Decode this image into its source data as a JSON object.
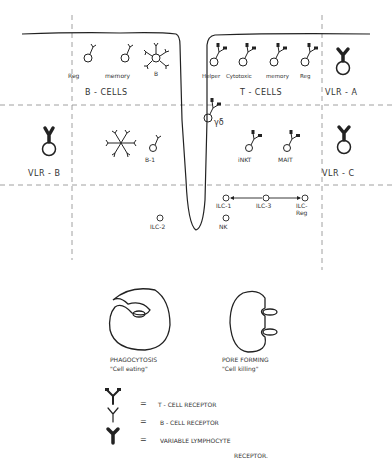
{
  "diagram": {
    "groups": {
      "b_cells": "B - CELLS",
      "t_cells": "T - CELLS",
      "vlr_a": "VLR - A",
      "vlr_b": "VLR - B",
      "vlr_c": "VLR - C"
    },
    "b_cell_types": [
      "Reg",
      "memory",
      "B",
      "B-1"
    ],
    "t_cell_types": [
      "Helper",
      "Cytotoxic",
      "memory",
      "Reg",
      "γδ",
      "iNKT",
      "MAIT"
    ],
    "innate_cells": [
      "ILC-2",
      "NK",
      "ILC-1",
      "ILC-3",
      "ILC-Reg"
    ],
    "mechanisms": [
      {
        "name": "PHAGOCYTOSIS",
        "desc": "\"Cell eating\""
      },
      {
        "name": "PORE FORMING",
        "desc": "\"Cell killing\""
      }
    ],
    "legend": [
      {
        "symbol": "=",
        "label": "T - CELL RECEPTOR"
      },
      {
        "symbol": "=",
        "label": "B - CELL RECEPTOR"
      },
      {
        "symbol": "=",
        "label": "VARIABLE LYMPHOCYTE"
      },
      {
        "symbol": "",
        "label": "RECEPTOR."
      }
    ]
  }
}
